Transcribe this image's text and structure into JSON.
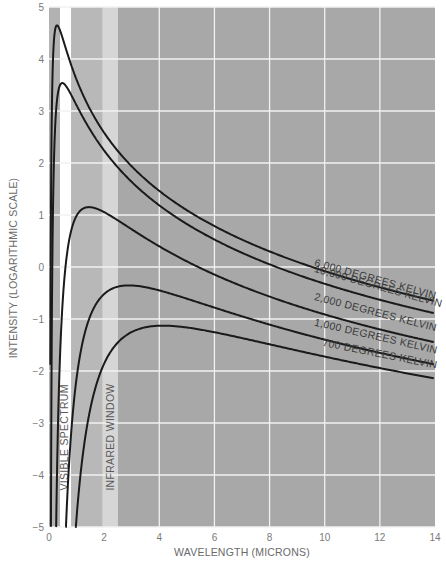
{
  "chart_data": {
    "type": "line",
    "title": "",
    "xlabel": "WAVELENGTH (MICRONS)",
    "ylabel": "INTENSITY (LOGARITHMIC SCALE)",
    "xlim": [
      0,
      14
    ],
    "ylim": [
      -5,
      5
    ],
    "x_ticks": [
      "0",
      "2",
      "4",
      "6",
      "8",
      "10",
      "12",
      "14"
    ],
    "y_ticks": [
      "5",
      "4",
      "3",
      "2",
      "1",
      "0",
      "−1",
      "−2",
      "−3",
      "−4",
      "−5"
    ],
    "grid": true,
    "legend_position": "inline labels along curves at right",
    "bands": [
      {
        "name": "VISIBLE SPECTRUM",
        "from": 0.0,
        "to": 0.4,
        "color": "#b2b2b2"
      },
      {
        "name": "visible-gap",
        "from": 0.4,
        "to": 0.8,
        "color": "#ffffff"
      },
      {
        "name": "near-infrared",
        "from": 0.8,
        "to": 1.95,
        "color": "#b8b8b8"
      },
      {
        "name": "INFRARED WINDOW",
        "from": 1.95,
        "to": 2.5,
        "color": "#d6d6d6"
      },
      {
        "name": "far-infrared",
        "from": 2.5,
        "to": 14.0,
        "color": "#a8a8a8"
      }
    ],
    "band_labels": {
      "visible": "VISIBLE SPECTRUM",
      "infrared": "INFRARED WINDOW"
    },
    "series": [
      {
        "name": "10,000 DEGREES KELVIN",
        "temperature_k": 10000,
        "peak": {
          "x": 0.29,
          "y": 4.65
        },
        "points": [
          [
            0.5,
            4.39
          ],
          [
            1,
            3.6
          ],
          [
            2,
            2.58
          ],
          [
            4,
            1.46
          ],
          [
            6,
            0.79
          ],
          [
            10,
            -0.08
          ],
          [
            14,
            -0.66
          ]
        ]
      },
      {
        "name": "6,000 DEGREES KELVIN",
        "temperature_k": 6000,
        "peak": {
          "x": 0.48,
          "y": 3.5
        },
        "points": [
          [
            1,
            3.1
          ],
          [
            2,
            2.2
          ],
          [
            4,
            1.15
          ],
          [
            6,
            0.5
          ],
          [
            10,
            -0.33
          ],
          [
            14,
            -0.89
          ]
        ]
      },
      {
        "name": "2,000 DEGREES KELVIN",
        "temperature_k": 2000,
        "peak": {
          "x": 1.45,
          "y": 1.15
        },
        "points": [
          [
            1,
            0.95
          ],
          [
            2,
            1.05
          ],
          [
            4,
            0.45
          ],
          [
            6,
            -0.05
          ],
          [
            10,
            -0.8
          ],
          [
            14,
            -1.33
          ]
        ]
      },
      {
        "name": "1,000 DEGREES KELVIN",
        "temperature_k": 1000,
        "peak": {
          "x": 2.9,
          "y": -0.35
        },
        "points": [
          [
            1,
            -1.85
          ],
          [
            2,
            -0.55
          ],
          [
            4,
            -0.5
          ],
          [
            6,
            -0.8
          ],
          [
            10,
            -1.4
          ],
          [
            14,
            -1.87
          ]
        ]
      },
      {
        "name": "700 DEGREES KELVIN",
        "temperature_k": 700,
        "peak": {
          "x": 4.14,
          "y": -1.13
        },
        "points": [
          [
            2,
            -1.75
          ],
          [
            4,
            -1.13
          ],
          [
            6,
            -1.25
          ],
          [
            10,
            -1.7
          ],
          [
            14,
            -2.14
          ]
        ]
      }
    ],
    "model": {
      "c2_micron_kelvin": 14388,
      "log_offset": 4.11
    },
    "colors": {
      "curve": "#1a1a1a",
      "grid": "#f2f2f2",
      "background": "#a8a8a8"
    }
  }
}
